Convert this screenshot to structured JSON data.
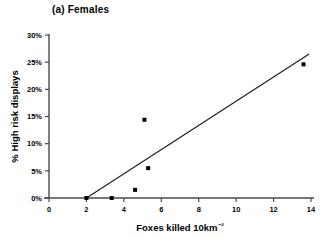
{
  "figure": {
    "panel_label": "(a) Females"
  },
  "chart_data": {
    "type": "scatter",
    "title": "(a) Females",
    "xlabel": "Foxes killed 10km⁻²",
    "ylabel": "% High risk displays",
    "xlim": [
      0,
      14
    ],
    "ylim": [
      0,
      30
    ],
    "xticks": [
      0,
      2,
      4,
      6,
      8,
      10,
      12,
      14
    ],
    "xticklabels": [
      "0",
      "2",
      "4",
      "6",
      "8",
      "10",
      "12",
      "14"
    ],
    "yticks": [
      0,
      5,
      10,
      15,
      20,
      25,
      30
    ],
    "yticklabels": [
      "0%",
      "5%",
      "10%",
      "15%",
      "20%",
      "25%",
      "30%"
    ],
    "grid": false,
    "legend": null,
    "points": [
      {
        "x": 2.0,
        "y": 0.0
      },
      {
        "x": 3.35,
        "y": 0.0
      },
      {
        "x": 4.6,
        "y": 1.5
      },
      {
        "x": 5.1,
        "y": 14.4
      },
      {
        "x": 5.3,
        "y": 5.5
      },
      {
        "x": 13.6,
        "y": 24.6
      }
    ],
    "fit_line": {
      "type": "linear-regression",
      "x_start": 2.0,
      "y_start": 0.0,
      "x_end": 13.9,
      "y_end": 26.5
    },
    "marker": {
      "shape": "square",
      "color": "#000000",
      "size_px": 4
    }
  }
}
